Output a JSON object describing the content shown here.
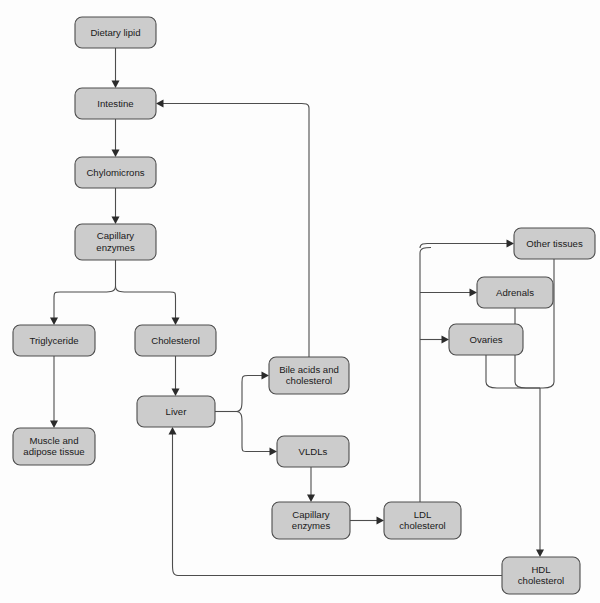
{
  "diagram": {
    "colors": {
      "node_fill": "#cccccc",
      "node_stroke": "#4d4d4d",
      "edge_stroke": "#4d4d4d",
      "background": "#fdfdfd",
      "text": "#1a1a1a"
    },
    "nodes": [
      {
        "id": "dietary_lipid",
        "label": "Dietary lipid",
        "lines": [
          "Dietary lipid"
        ],
        "x": 75,
        "y": 17,
        "w": 81,
        "h": 31
      },
      {
        "id": "intestine",
        "label": "Intestine",
        "lines": [
          "Intestine"
        ],
        "x": 75,
        "y": 88,
        "w": 81,
        "h": 31
      },
      {
        "id": "chylomicrons",
        "label": "Chylomicrons",
        "lines": [
          "Chylomicrons"
        ],
        "x": 75,
        "y": 157,
        "w": 81,
        "h": 31
      },
      {
        "id": "capillary_enzymes_top",
        "label": "Capillary enzymes",
        "lines": [
          "Capillary",
          "enzymes"
        ],
        "x": 75,
        "y": 224,
        "w": 81,
        "h": 36
      },
      {
        "id": "triglyceride",
        "label": "Triglyceride",
        "lines": [
          "Triglyceride"
        ],
        "x": 13,
        "y": 325,
        "w": 82,
        "h": 31
      },
      {
        "id": "cholesterol",
        "label": "Cholesterol",
        "lines": [
          "Cholesterol"
        ],
        "x": 135,
        "y": 325,
        "w": 81,
        "h": 31
      },
      {
        "id": "muscle_adipose",
        "label": "Muscle and adipose tissue",
        "lines": [
          "Muscle and",
          "adipose tissue"
        ],
        "x": 13,
        "y": 428,
        "w": 82,
        "h": 37
      },
      {
        "id": "liver",
        "label": "Liver",
        "lines": [
          "Liver"
        ],
        "x": 137,
        "y": 396,
        "w": 78,
        "h": 31
      },
      {
        "id": "bile_acids",
        "label": "Bile acids and cholesterol",
        "lines": [
          "Bile acids and",
          "cholesterol"
        ],
        "x": 269,
        "y": 357,
        "w": 80,
        "h": 37
      },
      {
        "id": "vldls",
        "label": "VLDLs",
        "lines": [
          "VLDLs"
        ],
        "x": 277,
        "y": 436,
        "w": 72,
        "h": 31
      },
      {
        "id": "capillary_enzymes_bottom",
        "label": "Capillary enzymes",
        "lines": [
          "Capillary",
          "enzymes"
        ],
        "x": 272,
        "y": 502,
        "w": 78,
        "h": 37
      },
      {
        "id": "ldl_cholesterol",
        "label": "LDL cholesterol",
        "lines": [
          "LDL",
          "cholesterol"
        ],
        "x": 384,
        "y": 502,
        "w": 77,
        "h": 37
      },
      {
        "id": "other_tissues",
        "label": "Other tissues",
        "lines": [
          "Other tissues"
        ],
        "x": 514,
        "y": 228,
        "w": 81,
        "h": 31
      },
      {
        "id": "adrenals",
        "label": "Adrenals",
        "lines": [
          "Adrenals"
        ],
        "x": 477,
        "y": 277,
        "w": 76,
        "h": 31
      },
      {
        "id": "ovaries",
        "label": "Ovaries",
        "lines": [
          "Ovaries"
        ],
        "x": 449,
        "y": 324,
        "w": 74,
        "h": 31
      },
      {
        "id": "hdl_cholesterol",
        "label": "HDL cholesterol",
        "lines": [
          "HDL",
          "cholesterol"
        ],
        "x": 502,
        "y": 557,
        "w": 78,
        "h": 37
      }
    ],
    "edges": [
      {
        "id": "dietary-to-intestine",
        "from": "dietary_lipid",
        "to": "intestine",
        "path": "M115.5,48 L115.5,84",
        "arrow": {
          "x": 115.5,
          "y": 88,
          "dir": "down"
        }
      },
      {
        "id": "intestine-to-chylomicrons",
        "from": "intestine",
        "to": "chylomicrons",
        "path": "M115.5,119 L115.5,153",
        "arrow": {
          "x": 115.5,
          "y": 157,
          "dir": "down"
        }
      },
      {
        "id": "chylomicrons-to-capillary",
        "from": "chylomicrons",
        "to": "capillary_enzymes_top",
        "path": "M115.5,188 L115.5,220",
        "arrow": {
          "x": 115.5,
          "y": 224,
          "dir": "down"
        }
      },
      {
        "id": "capillary-split-trunk",
        "from": "capillary_enzymes_top",
        "to": "split",
        "path": "M115.5,260 L115.5,286",
        "arrow": null
      },
      {
        "id": "capillary-to-triglyceride",
        "from": "capillary_enzymes_top",
        "to": "triglyceride",
        "path": "M115.5,286 C115.5,292 110,292 104,292 L60,292 C54.5,292 54,292.5 54,298 L54,321",
        "arrow": {
          "x": 54,
          "y": 325,
          "dir": "down"
        }
      },
      {
        "id": "capillary-to-cholesterol",
        "from": "capillary_enzymes_top",
        "to": "cholesterol",
        "path": "M115.5,286 C115.5,292 121,292 127,292 L170,292 C175.5,292 175.5,292.5 175.5,298 L175.5,321",
        "arrow": {
          "x": 175.5,
          "y": 325,
          "dir": "down"
        }
      },
      {
        "id": "triglyceride-to-muscle",
        "from": "triglyceride",
        "to": "muscle_adipose",
        "path": "M54,356 L54,424",
        "arrow": {
          "x": 54,
          "y": 428,
          "dir": "down"
        }
      },
      {
        "id": "cholesterol-to-liver",
        "from": "cholesterol",
        "to": "liver",
        "path": "M175.5,356 L175.5,392",
        "arrow": {
          "x": 175.5,
          "y": 396,
          "dir": "down"
        }
      },
      {
        "id": "liver-split-trunk",
        "from": "liver",
        "to": "split2",
        "path": "M215,411.5 L236,411.5",
        "arrow": null
      },
      {
        "id": "liver-to-bile-acids",
        "from": "liver",
        "to": "bile_acids",
        "path": "M236,411.5 C242,411.5 242,406 242,400 L242,382 C242,376.5 242.5,375.5 248,375.5 L265,375.5",
        "arrow": {
          "x": 269,
          "y": 375.5,
          "dir": "right"
        }
      },
      {
        "id": "liver-to-vldls",
        "from": "liver",
        "to": "vldls",
        "path": "M236,411.5 C242,411.5 242,417 242,423 L242,446 C242,451.5 242.5,451.5 248,451.5 L273,451.5",
        "arrow": {
          "x": 277,
          "y": 451.5,
          "dir": "right"
        }
      },
      {
        "id": "bile-acids-to-intestine",
        "from": "bile_acids",
        "to": "intestine",
        "path": "M309,357 L309,108 C309,102.5 303.5,103.5 298,103.5 L160,103.5",
        "arrow": {
          "x": 156,
          "y": 103.5,
          "dir": "left"
        }
      },
      {
        "id": "vldls-to-capillary-bottom",
        "from": "vldls",
        "to": "capillary_enzymes_bottom",
        "path": "M311,467 L311,498",
        "arrow": {
          "x": 311,
          "y": 502,
          "dir": "down"
        }
      },
      {
        "id": "capillary-bottom-to-ldl",
        "from": "capillary_enzymes_bottom",
        "to": "ldl_cholesterol",
        "path": "M350,520.5 L380,520.5",
        "arrow": {
          "x": 384,
          "y": 520.5,
          "dir": "right"
        }
      },
      {
        "id": "ldl-trunk-up",
        "from": "ldl_cholesterol",
        "to": "tissue-split",
        "path": "M420,502 L420,253 C420,247.5 425.5,247.5 431,247.5",
        "arrow": null
      },
      {
        "id": "ldl-to-other-tissues",
        "from": "ldl_cholesterol",
        "to": "other_tissues",
        "path": "M420,248 C420,242.5 425.5,243.5 431,243.5 L431,243.5 C436.5,243.5 436.5,243.5 442,243.5 L510,243.5",
        "arrow": {
          "x": 514,
          "y": 243.5,
          "dir": "right"
        }
      },
      {
        "id": "ldl-to-adrenals",
        "from": "ldl_cholesterol",
        "to": "adrenals",
        "path": "M420,292.5 L473,292.5",
        "arrow": {
          "x": 477,
          "y": 292.5,
          "dir": "right"
        }
      },
      {
        "id": "ldl-to-ovaries",
        "from": "ldl_cholesterol",
        "to": "ovaries",
        "path": "M420,339.5 L445,339.5",
        "arrow": {
          "x": 449,
          "y": 339.5,
          "dir": "right"
        }
      },
      {
        "id": "other-tissues-to-merge",
        "from": "other_tissues",
        "to": "hdl_cholesterol",
        "path": "M554,259 L554,382 C554,387.5 548.5,388 543,388 L540,388",
        "arrow": null
      },
      {
        "id": "adrenals-to-merge",
        "from": "adrenals",
        "to": "hdl_cholesterol",
        "path": "M515,308 L515,382 C515,387.5 520.5,388 526,388 L540,388",
        "arrow": null
      },
      {
        "id": "ovaries-to-merge",
        "from": "ovaries",
        "to": "hdl_cholesterol",
        "path": "M486,355 L486,382 C486,387.5 491.5,388 497,388 L540,388",
        "arrow": null
      },
      {
        "id": "merge-to-hdl",
        "from": "tissues",
        "to": "hdl_cholesterol",
        "path": "M540,388 L540,553",
        "arrow": {
          "x": 540,
          "y": 557,
          "dir": "down"
        }
      },
      {
        "id": "hdl-to-liver",
        "from": "hdl_cholesterol",
        "to": "liver",
        "path": "M502,575.5 L178,575.5 C172.5,575.5 172.5,570 172.5,564.5 L172.5,431",
        "arrow": {
          "x": 172.5,
          "y": 427,
          "dir": "up"
        }
      }
    ]
  }
}
